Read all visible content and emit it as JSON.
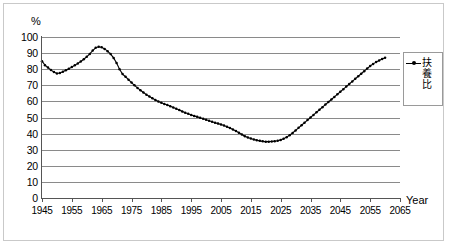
{
  "axes": {
    "y_unit_label": "%",
    "x_unit_label": "Year",
    "y_ticks": [
      "100",
      "90",
      "80",
      "70",
      "60",
      "50",
      "40",
      "30",
      "20",
      "10",
      "0"
    ],
    "x_ticks": [
      "1945",
      "1955",
      "1965",
      "1975",
      "1985",
      "1995",
      "2005",
      "2015",
      "2025",
      "2035",
      "2045",
      "2055",
      "2065"
    ]
  },
  "legend": {
    "entry_label": "扶養比",
    "entry_chars": [
      "扶",
      "養",
      "比"
    ],
    "symbol_name": "line-with-marker"
  },
  "colors": {
    "series": "#000000",
    "gridline": "#8a8a8a",
    "axis": "#555555",
    "frame": "#c9c9c9",
    "background": "#ffffff"
  },
  "chart_data": {
    "type": "line",
    "title": "",
    "xlabel": "Year",
    "ylabel": "%",
    "xlim": [
      1945,
      2065
    ],
    "ylim": [
      0,
      100
    ],
    "ytick_step": 10,
    "xtick_step": 10,
    "grid": true,
    "legend_position": "right",
    "series": [
      {
        "name": "扶養比",
        "marker": "dot",
        "x": [
          1945,
          1946,
          1947,
          1948,
          1949,
          1950,
          1951,
          1952,
          1953,
          1954,
          1955,
          1956,
          1957,
          1958,
          1959,
          1960,
          1961,
          1962,
          1963,
          1964,
          1965,
          1966,
          1967,
          1968,
          1969,
          1970,
          1971,
          1972,
          1973,
          1974,
          1975,
          1976,
          1977,
          1978,
          1979,
          1980,
          1981,
          1982,
          1983,
          1984,
          1985,
          1986,
          1987,
          1988,
          1989,
          1990,
          1991,
          1992,
          1993,
          1994,
          1995,
          1996,
          1997,
          1998,
          1999,
          2000,
          2001,
          2002,
          2003,
          2004,
          2005,
          2006,
          2007,
          2008,
          2009,
          2010,
          2011,
          2012,
          2013,
          2014,
          2015,
          2016,
          2017,
          2018,
          2019,
          2020,
          2021,
          2022,
          2023,
          2024,
          2025,
          2026,
          2027,
          2028,
          2029,
          2030,
          2031,
          2032,
          2033,
          2034,
          2035,
          2036,
          2037,
          2038,
          2039,
          2040,
          2041,
          2042,
          2043,
          2044,
          2045,
          2046,
          2047,
          2048,
          2049,
          2050,
          2051,
          2052,
          2053,
          2054,
          2055,
          2056,
          2057,
          2058,
          2059,
          2060
        ],
        "values": [
          85.0,
          82.5,
          81.0,
          79.5,
          78.2,
          77.3,
          77.6,
          78.4,
          79.3,
          80.3,
          81.3,
          82.4,
          83.6,
          84.8,
          86.2,
          87.7,
          89.5,
          91.6,
          93.3,
          93.9,
          93.6,
          92.6,
          91.2,
          89.4,
          87.0,
          83.8,
          80.0,
          77.0,
          75.3,
          73.5,
          71.7,
          70.0,
          68.4,
          66.9,
          65.5,
          64.2,
          63.0,
          61.9,
          60.9,
          60.0,
          59.2,
          58.4,
          57.7,
          57.0,
          56.2,
          55.4,
          54.6,
          53.8,
          53.0,
          52.3,
          51.6,
          51.0,
          50.4,
          49.8,
          49.2,
          48.6,
          48.0,
          47.4,
          46.8,
          46.2,
          45.6,
          45.0,
          44.3,
          43.5,
          42.6,
          41.6,
          40.5,
          39.4,
          38.4,
          37.6,
          37.0,
          36.4,
          35.9,
          35.5,
          35.2,
          35.0,
          35.0,
          35.1,
          35.3,
          35.6,
          36.1,
          36.8,
          37.8,
          39.0,
          40.4,
          42.0,
          43.6,
          45.2,
          46.8,
          48.4,
          50.0,
          51.6,
          53.2,
          54.8,
          56.4,
          58.0,
          59.6,
          61.2,
          62.8,
          64.4,
          66.0,
          67.6,
          69.2,
          70.8,
          72.4,
          74.0,
          75.6,
          77.2,
          78.8,
          80.4,
          82.0,
          83.3,
          84.4,
          85.4,
          86.3,
          87.1
        ]
      }
    ],
    "annotations": {
      "start_value": 85.0,
      "local_min_early": {
        "year": 1950,
        "value": 77.3
      },
      "peak": {
        "year": 1964,
        "value": 93.9
      },
      "global_min": {
        "year": 2021,
        "value": 35.0
      },
      "end_value": {
        "year": 2060,
        "value": 97.0
      }
    }
  }
}
